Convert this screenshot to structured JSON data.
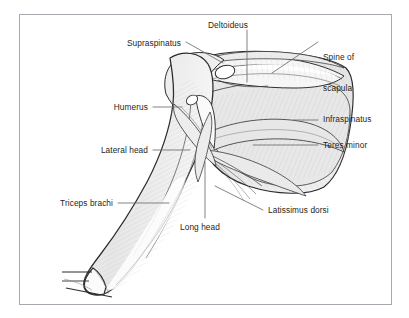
{
  "figure": {
    "kind": "anatomical-illustration",
    "frame_color": "#a9a9b2",
    "background_color": "#ffffff",
    "label_color": "#231f20",
    "leader_color": "#6d6d73",
    "muscle_fill": "#e9e9e9",
    "outline_color": "#2b2b2b",
    "highlight_color": "#ffffff"
  },
  "labels": [
    {
      "id": "supraspinatus",
      "text": "Supraspinatus",
      "align": "right",
      "x": 181,
      "y": 38,
      "lines": [
        "Supraspinatus"
      ]
    },
    {
      "id": "deltoideus",
      "text": "Deltoideus",
      "align": "center",
      "x": 228,
      "y": 20,
      "lines": [
        "Deltoideus"
      ]
    },
    {
      "id": "spine-of-scapula",
      "text": "Spine of scapula",
      "align": "left",
      "x": 323,
      "y": 32,
      "lines": [
        "Spine of",
        "scapula"
      ]
    },
    {
      "id": "humerus",
      "text": "Humerus",
      "align": "right",
      "x": 148,
      "y": 102,
      "lines": [
        "Humerus"
      ]
    },
    {
      "id": "infraspinatus",
      "text": "Infraspinatus",
      "align": "left",
      "x": 323,
      "y": 114,
      "lines": [
        "Infraspinatus"
      ]
    },
    {
      "id": "teres-minor",
      "text": "Teres minor",
      "align": "left",
      "x": 323,
      "y": 140,
      "lines": [
        "Teres minor"
      ]
    },
    {
      "id": "lateral-head",
      "text": "Lateral head",
      "align": "right",
      "x": 148,
      "y": 145,
      "lines": [
        "Lateral head"
      ]
    },
    {
      "id": "triceps-brachi",
      "text": "Triceps brachi",
      "align": "right",
      "x": 113,
      "y": 198,
      "lines": [
        "Triceps brachi"
      ]
    },
    {
      "id": "latissimus-dorsi",
      "text": "Latissimus dorsi",
      "align": "left",
      "x": 268,
      "y": 205,
      "lines": [
        "Latissimus dorsi"
      ]
    },
    {
      "id": "long-head",
      "text": "Long head",
      "align": "center",
      "x": 199,
      "y": 222,
      "lines": [
        "Long head"
      ]
    }
  ],
  "leaders": [
    {
      "id": "leader-supraspinatus",
      "from": [
        186,
        42
      ],
      "to": [
        223,
        63
      ]
    },
    {
      "id": "leader-deltoideus",
      "from": [
        247,
        30
      ],
      "to": [
        247,
        82
      ]
    },
    {
      "id": "leader-spine-of-scapula",
      "from": [
        318,
        42
      ],
      "to": [
        272,
        73
      ]
    },
    {
      "id": "leader-humerus",
      "from": [
        153,
        107
      ],
      "to": [
        182,
        107
      ]
    },
    {
      "id": "leader-infraspinatus",
      "from": [
        318,
        120
      ],
      "to": [
        293,
        120
      ]
    },
    {
      "id": "leader-teres-minor",
      "from": [
        318,
        145
      ],
      "to": [
        253,
        145
      ]
    },
    {
      "id": "leader-lateral-head",
      "from": [
        153,
        150
      ],
      "to": [
        190,
        150
      ]
    },
    {
      "id": "leader-triceps-brachi",
      "from": [
        118,
        203
      ],
      "to": [
        169,
        203
      ]
    },
    {
      "id": "leader-latissimus-dorsi",
      "from": [
        263,
        210
      ],
      "to": [
        215,
        186
      ]
    },
    {
      "id": "leader-long-head",
      "from": [
        205,
        218
      ],
      "to": [
        205,
        162
      ]
    }
  ],
  "structures": [
    {
      "id": "humerus-shaft",
      "name": "Humerus"
    },
    {
      "id": "scapula-body",
      "name": "Scapula"
    },
    {
      "id": "spine-scapula",
      "name": "Spine of scapula"
    },
    {
      "id": "supraspinatus-m",
      "name": "Supraspinatus muscle"
    },
    {
      "id": "infraspinatus-m",
      "name": "Infraspinatus muscle"
    },
    {
      "id": "teres-minor-m",
      "name": "Teres minor muscle"
    },
    {
      "id": "deltoideus-m",
      "name": "Deltoideus muscle"
    },
    {
      "id": "latissimus-m",
      "name": "Latissimus dorsi muscle"
    },
    {
      "id": "triceps-lateral",
      "name": "Triceps brachii lateral head"
    },
    {
      "id": "triceps-long",
      "name": "Triceps brachii long head"
    },
    {
      "id": "olecranon",
      "name": "Olecranon / elbow"
    }
  ]
}
